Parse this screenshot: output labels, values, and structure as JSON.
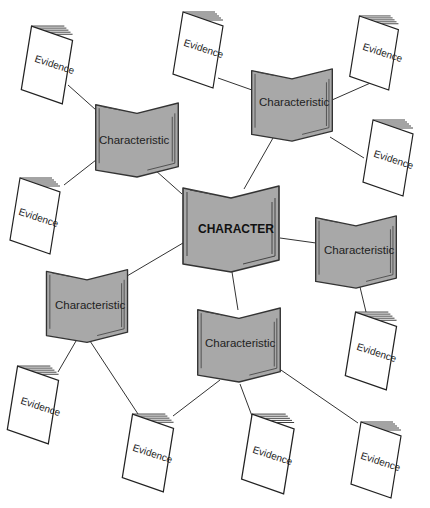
{
  "diagram": {
    "center": {
      "label": "CHARACTER"
    },
    "characteristics": [
      {
        "id": "c1",
        "label": "Characteristic"
      },
      {
        "id": "c2",
        "label": "Characteristic"
      },
      {
        "id": "c3",
        "label": "Characteristic"
      },
      {
        "id": "c4",
        "label": "Characteristic"
      },
      {
        "id": "c5",
        "label": "Characteristic"
      }
    ],
    "evidence": [
      {
        "id": "e1",
        "parent": "c1",
        "label": "Evidence"
      },
      {
        "id": "e2",
        "parent": "c1",
        "label": "Evidence"
      },
      {
        "id": "e3",
        "parent": "c2",
        "label": "Evidence"
      },
      {
        "id": "e4",
        "parent": "c2",
        "label": "Evidence"
      },
      {
        "id": "e5",
        "parent": "c2",
        "label": "Evidence"
      },
      {
        "id": "e6",
        "parent": "c3",
        "label": "Evidence"
      },
      {
        "id": "e7",
        "parent": "c4",
        "label": "Evidence"
      },
      {
        "id": "e8",
        "parent": "c4",
        "label": "Evidence"
      },
      {
        "id": "e9",
        "parent": "c5",
        "label": "Evidence"
      },
      {
        "id": "e10",
        "parent": "c5",
        "label": "Evidence"
      }
    ],
    "colors": {
      "book_fill": "#a8a8a8",
      "outline": "#333333",
      "page": "#ffffff"
    }
  }
}
